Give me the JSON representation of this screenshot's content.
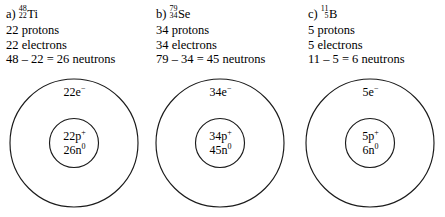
{
  "page": {
    "top_cut_text": "__________"
  },
  "problems": [
    {
      "label": "a)",
      "mass_number": "48",
      "atomic_number": "22",
      "symbol": "Ti",
      "protons_line": "22 protons",
      "electrons_line": "22 electrons",
      "neutrons_line": "48 – 22 = 26 neutrons",
      "diagram": {
        "electron_count": "22",
        "electron_suffix": "e",
        "electron_charge": "−",
        "proton_count": "22",
        "proton_suffix": "p",
        "proton_charge": "+",
        "neutron_count": "26",
        "neutron_suffix": "n",
        "neutron_charge": "0"
      }
    },
    {
      "label": "b)",
      "mass_number": "79",
      "atomic_number": "34",
      "symbol": "Se",
      "protons_line": "34 protons",
      "electrons_line": "34 electrons",
      "neutrons_line": "79 – 34 = 45 neutrons",
      "diagram": {
        "electron_count": "34",
        "electron_suffix": "e",
        "electron_charge": "−",
        "proton_count": "34",
        "proton_suffix": "p",
        "proton_charge": "+",
        "neutron_count": "45",
        "neutron_suffix": "n",
        "neutron_charge": "0"
      }
    },
    {
      "label": "c)",
      "mass_number": "11",
      "atomic_number": "5",
      "symbol": "B",
      "protons_line": "5 protons",
      "electrons_line": "5 electrons",
      "neutrons_line": "11 – 5 = 6 neutrons",
      "diagram": {
        "electron_count": "5",
        "electron_suffix": "e",
        "electron_charge": "−",
        "proton_count": "5",
        "proton_suffix": "p",
        "proton_charge": "+",
        "neutron_count": "6",
        "neutron_suffix": "n",
        "neutron_charge": "0"
      }
    }
  ],
  "colors": {
    "stroke": "#1b1b1b",
    "text": "#000000",
    "background": "#ffffff"
  }
}
